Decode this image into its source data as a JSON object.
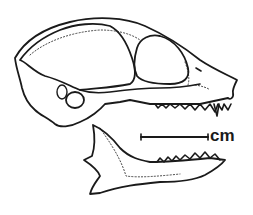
{
  "figure": {
    "scale_bar": {
      "label": "cm",
      "x1": 141,
      "x2": 208,
      "y": 137
    },
    "colors": {
      "line": "#1a1a1a",
      "background": "#ffffff"
    }
  }
}
